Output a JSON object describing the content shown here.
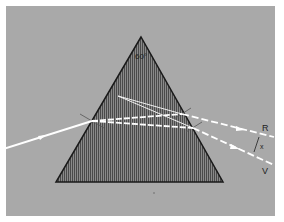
{
  "diagram": {
    "apex_angle_label": "60°",
    "labels": {
      "red": "R",
      "violet": "V",
      "separation": "x"
    },
    "colors": {
      "background": "#a9a9a9",
      "prism_fill": "#6e6e6e",
      "prism_stroke": "#1a1a1a",
      "ray": "#ffffff"
    },
    "prism": {
      "apex": [
        141,
        37
      ],
      "base_left": [
        56,
        182
      ],
      "base_right": [
        223,
        182
      ]
    },
    "rays": {
      "incident": {
        "from": [
          0,
          150
        ],
        "to": [
          92,
          121
        ]
      },
      "red_internal": {
        "from": [
          92,
          121
        ],
        "to": [
          182,
          114
        ]
      },
      "violet_internal": {
        "from": [
          92,
          121
        ],
        "to": [
          193,
          128
        ]
      },
      "red_emergent": {
        "from": [
          182,
          114
        ],
        "to": [
          274,
          137
        ]
      },
      "violet_emergent": {
        "from": [
          193,
          128
        ],
        "to": [
          274,
          165
        ]
      },
      "reflected_1": {
        "from": [
          182,
          114
        ],
        "to": [
          118,
          96
        ]
      },
      "reflected_2": {
        "from": [
          193,
          128
        ],
        "to": [
          118,
          96
        ]
      }
    }
  }
}
